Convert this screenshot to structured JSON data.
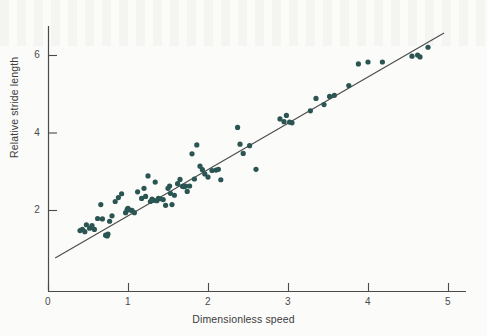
{
  "figure": {
    "background_color": "#fbfbf9",
    "ink_color": "#3a3a3a",
    "point_color": "#2a5552"
  },
  "axes": {
    "x_title": "Dimensionless speed",
    "y_title": "Relative stride length",
    "x_ticks": [
      "0",
      "1",
      "2",
      "3",
      "4",
      "5"
    ],
    "y_ticks": [
      "2",
      "4",
      "6"
    ]
  },
  "chart_data": {
    "type": "scatter",
    "title": "",
    "xlabel": "Dimensionless speed",
    "ylabel": "Relative stride length",
    "xlim": [
      0,
      5.1
    ],
    "ylim": [
      0,
      6.8
    ],
    "xticks": [
      0,
      1,
      2,
      3,
      4,
      5
    ],
    "yticks": [
      2,
      4,
      6
    ],
    "grid": false,
    "legend": null,
    "marker": "filled-circle",
    "marker_color": "#2a5552",
    "marker_size_px": 4.6,
    "fit_line": {
      "type": "linear",
      "color": "#4a4a4a",
      "x_start": 0.09,
      "y_start": 0.76,
      "x_end": 4.95,
      "y_end": 6.57,
      "slope": 1.196,
      "intercept": 0.652
    },
    "points": [
      [
        0.4,
        1.47
      ],
      [
        0.43,
        1.5
      ],
      [
        0.46,
        1.44
      ],
      [
        0.48,
        1.62
      ],
      [
        0.52,
        1.53
      ],
      [
        0.55,
        1.6
      ],
      [
        0.58,
        1.5
      ],
      [
        0.62,
        1.78
      ],
      [
        0.66,
        2.14
      ],
      [
        0.68,
        1.77
      ],
      [
        0.72,
        1.35
      ],
      [
        0.74,
        1.33
      ],
      [
        0.75,
        1.38
      ],
      [
        0.77,
        1.71
      ],
      [
        0.8,
        1.85
      ],
      [
        0.84,
        2.22
      ],
      [
        0.88,
        2.32
      ],
      [
        0.92,
        2.42
      ],
      [
        0.97,
        1.93
      ],
      [
        0.99,
        2.02
      ],
      [
        1.0,
        2.04
      ],
      [
        1.02,
        2.0
      ],
      [
        1.05,
        1.99
      ],
      [
        1.08,
        1.93
      ],
      [
        1.12,
        2.47
      ],
      [
        1.17,
        2.3
      ],
      [
        1.2,
        2.56
      ],
      [
        1.22,
        2.35
      ],
      [
        1.25,
        2.88
      ],
      [
        1.28,
        2.22
      ],
      [
        1.3,
        2.28
      ],
      [
        1.32,
        2.25
      ],
      [
        1.34,
        2.72
      ],
      [
        1.36,
        2.24
      ],
      [
        1.38,
        2.3
      ],
      [
        1.4,
        2.29
      ],
      [
        1.44,
        2.27
      ],
      [
        1.47,
        2.12
      ],
      [
        1.5,
        2.56
      ],
      [
        1.52,
        2.62
      ],
      [
        1.53,
        2.43
      ],
      [
        1.55,
        2.14
      ],
      [
        1.58,
        2.38
      ],
      [
        1.62,
        2.68
      ],
      [
        1.65,
        2.79
      ],
      [
        1.68,
        2.61
      ],
      [
        1.7,
        2.6
      ],
      [
        1.72,
        2.62
      ],
      [
        1.74,
        2.48
      ],
      [
        1.77,
        2.62
      ],
      [
        1.8,
        3.45
      ],
      [
        1.83,
        2.8
      ],
      [
        1.86,
        3.68
      ],
      [
        1.9,
        3.13
      ],
      [
        1.93,
        3.04
      ],
      [
        1.96,
        2.93
      ],
      [
        2.0,
        2.85
      ],
      [
        2.05,
        3.02
      ],
      [
        2.1,
        3.03
      ],
      [
        2.13,
        3.05
      ],
      [
        2.16,
        2.78
      ],
      [
        2.37,
        4.13
      ],
      [
        2.4,
        3.7
      ],
      [
        2.44,
        3.46
      ],
      [
        2.52,
        3.66
      ],
      [
        2.6,
        3.05
      ],
      [
        2.9,
        4.35
      ],
      [
        2.95,
        4.28
      ],
      [
        2.98,
        4.44
      ],
      [
        3.02,
        4.27
      ],
      [
        3.05,
        4.25
      ],
      [
        3.28,
        4.56
      ],
      [
        3.35,
        4.88
      ],
      [
        3.45,
        4.72
      ],
      [
        3.52,
        4.93
      ],
      [
        3.58,
        4.96
      ],
      [
        3.76,
        5.21
      ],
      [
        3.88,
        5.77
      ],
      [
        4.0,
        5.82
      ],
      [
        4.18,
        5.82
      ],
      [
        4.55,
        5.97
      ],
      [
        4.62,
        6.0
      ],
      [
        4.65,
        5.95
      ],
      [
        4.75,
        6.2
      ]
    ]
  }
}
